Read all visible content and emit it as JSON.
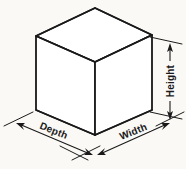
{
  "figure": {
    "background_color": "#faf9f6",
    "line_color": "#1a1a1a",
    "face_color": "#ffffff"
  },
  "labels": {
    "depth": "Depth",
    "width": "Width",
    "height": "Height"
  },
  "geometry": {
    "top_apex": {
      "x": 95,
      "y": 8
    },
    "top_left": {
      "x": 36,
      "y": 36
    },
    "top_right": {
      "x": 152,
      "y": 35
    },
    "front_top": {
      "x": 95,
      "y": 62
    },
    "bottom_left": {
      "x": 36,
      "y": 110
    },
    "bottom_right": {
      "x": 152,
      "y": 110
    },
    "bottom_front": {
      "x": 95,
      "y": 135
    }
  },
  "dimensions": [
    {
      "name": "depth",
      "label": "Depth",
      "orientation": "left-diagonal",
      "rotation_deg": 20
    },
    {
      "name": "width",
      "label": "Width",
      "orientation": "right-diagonal",
      "rotation_deg": -20
    },
    {
      "name": "height",
      "label": "Height",
      "orientation": "vertical",
      "rotation_deg": -90
    }
  ]
}
